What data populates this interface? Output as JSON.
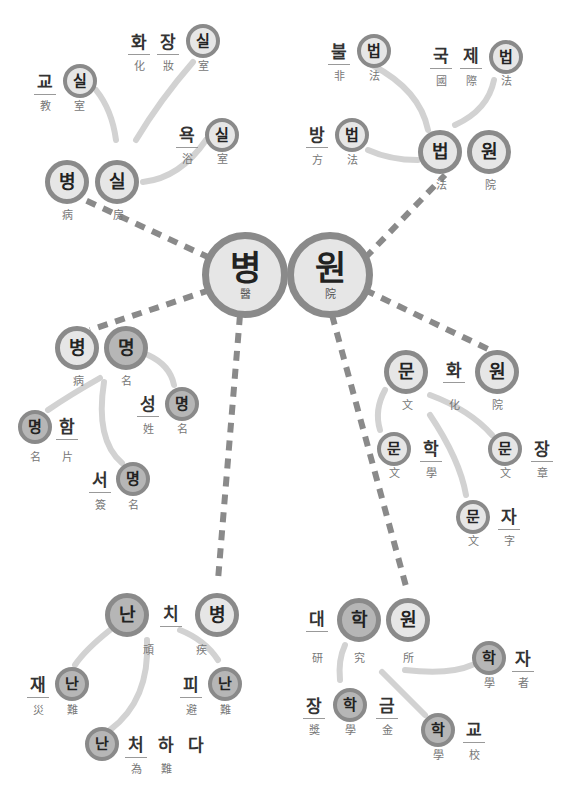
{
  "diagram": {
    "colors": {
      "dark_fill": "#b6b6b6",
      "light_fill": "#e6e6e6",
      "ring": "#8a8a8a",
      "dashed_link": "#8a8a8a",
      "soft_link": "#d4d4d4",
      "text": "#222222"
    },
    "center": {
      "syllables": [
        {
          "hangul": "병",
          "hanja": "醫"
        },
        {
          "hangul": "원",
          "hanja": "院"
        }
      ]
    },
    "clusters": [
      {
        "id": "byeongsil",
        "word": [
          {
            "hangul": "병",
            "hanja": "病"
          },
          {
            "hangul": "실",
            "hanja": "房"
          }
        ],
        "children": [
          {
            "word": [
              {
                "hangul": "교",
                "hanja": "教"
              },
              {
                "hangul": "실",
                "hanja": "室"
              }
            ]
          },
          {
            "word": [
              {
                "hangul": "화",
                "hanja": "化"
              },
              {
                "hangul": "장",
                "hanja": "妝"
              },
              {
                "hangul": "실",
                "hanja": "室"
              }
            ]
          },
          {
            "word": [
              {
                "hangul": "욕",
                "hanja": "浴"
              },
              {
                "hangul": "실",
                "hanja": "室"
              }
            ]
          }
        ]
      },
      {
        "id": "beobwon",
        "word": [
          {
            "hangul": "법",
            "hanja": "法"
          },
          {
            "hangul": "원",
            "hanja": "院"
          }
        ],
        "children": [
          {
            "word": [
              {
                "hangul": "불",
                "hanja": "非"
              },
              {
                "hangul": "법",
                "hanja": "法"
              }
            ]
          },
          {
            "word": [
              {
                "hangul": "국",
                "hanja": "國"
              },
              {
                "hangul": "제",
                "hanja": "際"
              },
              {
                "hangul": "법",
                "hanja": "法"
              }
            ]
          },
          {
            "word": [
              {
                "hangul": "방",
                "hanja": "方"
              },
              {
                "hangul": "법",
                "hanja": "法"
              }
            ]
          }
        ]
      },
      {
        "id": "byeongmyeong",
        "word": [
          {
            "hangul": "병",
            "hanja": "病"
          },
          {
            "hangul": "명",
            "hanja": "名"
          }
        ],
        "children": [
          {
            "word": [
              {
                "hangul": "성",
                "hanja": "姓"
              },
              {
                "hangul": "명",
                "hanja": "名"
              }
            ]
          },
          {
            "word": [
              {
                "hangul": "명",
                "hanja": "名"
              },
              {
                "hangul": "함",
                "hanja": "片"
              }
            ]
          },
          {
            "word": [
              {
                "hangul": "서",
                "hanja": "簽"
              },
              {
                "hangul": "명",
                "hanja": "名"
              }
            ]
          }
        ]
      },
      {
        "id": "munhwawon",
        "word": [
          {
            "hangul": "문",
            "hanja": "文"
          },
          {
            "hangul": "화",
            "hanja": "化"
          },
          {
            "hangul": "원",
            "hanja": "院"
          }
        ],
        "children": [
          {
            "word": [
              {
                "hangul": "문",
                "hanja": "文"
              },
              {
                "hangul": "학",
                "hanja": "學"
              }
            ]
          },
          {
            "word": [
              {
                "hangul": "문",
                "hanja": "文"
              },
              {
                "hangul": "장",
                "hanja": "章"
              }
            ]
          },
          {
            "word": [
              {
                "hangul": "문",
                "hanja": "文"
              },
              {
                "hangul": "자",
                "hanja": "字"
              }
            ]
          }
        ]
      },
      {
        "id": "nanchibyeong",
        "word": [
          {
            "hangul": "난",
            "hanja": ""
          },
          {
            "hangul": "치",
            "hanja": "頑"
          },
          {
            "hangul": "병",
            "hanja": "疾"
          }
        ],
        "children": [
          {
            "word": [
              {
                "hangul": "재",
                "hanja": "災"
              },
              {
                "hangul": "난",
                "hanja": "難"
              }
            ]
          },
          {
            "word": [
              {
                "hangul": "피",
                "hanja": "避"
              },
              {
                "hangul": "난",
                "hanja": "難"
              }
            ]
          },
          {
            "word": [
              {
                "hangul": "난",
                "hanja": "為"
              },
              {
                "hangul": "처",
                "hanja": "難"
              },
              {
                "hangul": "하",
                "hanja": ""
              },
              {
                "hangul": "다",
                "hanja": ""
              }
            ]
          }
        ]
      },
      {
        "id": "daehakwon",
        "word": [
          {
            "hangul": "대",
            "hanja": "研"
          },
          {
            "hangul": "학",
            "hanja": "究"
          },
          {
            "hangul": "원",
            "hanja": "所"
          }
        ],
        "children": [
          {
            "word": [
              {
                "hangul": "학",
                "hanja": "學"
              },
              {
                "hangul": "자",
                "hanja": "者"
              }
            ]
          },
          {
            "word": [
              {
                "hangul": "장",
                "hanja": "獎"
              },
              {
                "hangul": "학",
                "hanja": "學"
              },
              {
                "hangul": "금",
                "hanja": "金"
              }
            ]
          },
          {
            "word": [
              {
                "hangul": "학",
                "hanja": "學"
              },
              {
                "hangul": "교",
                "hanja": "校"
              }
            ]
          }
        ]
      }
    ]
  }
}
